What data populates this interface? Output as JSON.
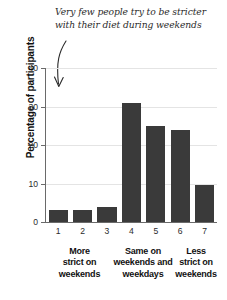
{
  "chart_data": {
    "type": "bar",
    "title": "",
    "subtitle": "",
    "xlabel": "",
    "ylabel": "Percentage of participants",
    "categories": [
      "1",
      "2",
      "3",
      "4",
      "5",
      "6",
      "7"
    ],
    "values": [
      3,
      3,
      4,
      31,
      25,
      24,
      9.5
    ],
    "ylim": [
      0,
      40
    ],
    "yticks": [
      0,
      10,
      20,
      30,
      40
    ],
    "ytick_labels": [
      "0",
      "10",
      "20",
      "30",
      "40"
    ],
    "grid": true,
    "legend": "none",
    "bar_color": "#3a3a3a",
    "gridline_color": "#e4e4e4",
    "axis_color": "#6a6a6a",
    "background_color": "#ffffff",
    "group_labels": [
      {
        "lines": [
          "More",
          "strict on",
          "weekends"
        ],
        "spans": [
          "1",
          "2",
          "3"
        ]
      },
      {
        "lines": [
          "Same on",
          "weekends and",
          "weekdays"
        ],
        "spans": [
          "4",
          "5"
        ]
      },
      {
        "lines": [
          "Less",
          "strict on",
          "weekends"
        ],
        "spans": [
          "6",
          "7"
        ]
      }
    ],
    "annotations": [
      {
        "text_lines": [
          "Very few people try to be stricter",
          "with their diet during weekends"
        ],
        "arrow": "curved-down-arrow",
        "points_to": "1"
      }
    ]
  }
}
